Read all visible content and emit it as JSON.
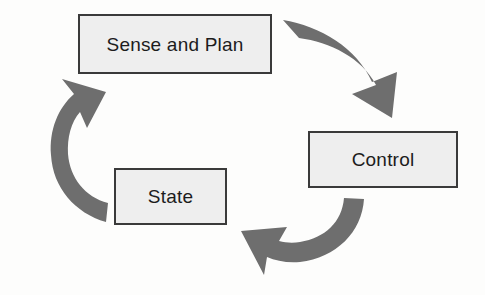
{
  "diagram": {
    "type": "cycle-diagram",
    "background_color": "#fdfdfc",
    "nodes": [
      {
        "id": "sense-and-plan",
        "label": "Sense and Plan",
        "fill_color": "#eeeeee",
        "border_color": "#3a3a3a"
      },
      {
        "id": "control",
        "label": "Control",
        "fill_color": "#eeeeee",
        "border_color": "#3a3a3a"
      },
      {
        "id": "state",
        "label": "State",
        "fill_color": "#eeeeee",
        "border_color": "#3a3a3a"
      }
    ],
    "arrows": [
      {
        "id": "arrow-sense-to-control",
        "from": "sense-and-plan",
        "to": "control",
        "direction": "clockwise-top-right",
        "color": "#6e6e6e"
      },
      {
        "id": "arrow-control-to-state",
        "from": "control",
        "to": "state",
        "direction": "clockwise-bottom",
        "color": "#6e6e6e"
      },
      {
        "id": "arrow-state-to-sense",
        "from": "state",
        "to": "sense-and-plan",
        "direction": "clockwise-left",
        "color": "#6e6e6e"
      }
    ]
  }
}
